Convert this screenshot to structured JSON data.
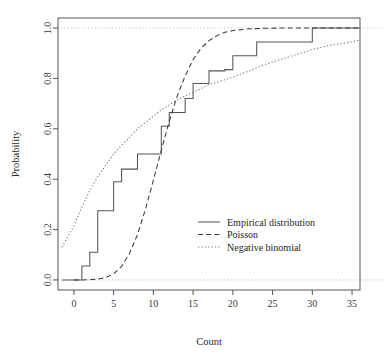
{
  "chart_data": {
    "type": "line",
    "title": "",
    "xlabel": "Count",
    "ylabel": "Probability",
    "xlim": [
      -2,
      36
    ],
    "ylim": [
      -0.04,
      1.04
    ],
    "grid": false,
    "reference_lines": [
      {
        "name": "upper-reference",
        "y": 1.0,
        "style": "dotted",
        "color": "#bdbdbd"
      },
      {
        "name": "lower-reference",
        "y": 0.0,
        "style": "dotted",
        "color": "#bdbdbd"
      }
    ],
    "xticks": [
      0,
      5,
      10,
      15,
      20,
      25,
      30,
      35
    ],
    "xtick_labels": [
      "0",
      "5",
      "10",
      "15",
      "20",
      "25",
      "30",
      "35"
    ],
    "yticks": [
      0.0,
      0.2,
      0.4,
      0.6,
      0.8,
      1.0
    ],
    "ytick_labels": [
      "0.0",
      "0.2",
      "0.4",
      "0.6",
      "0.8",
      "1.0"
    ],
    "legend_position": "center-right",
    "legend": [
      {
        "label": "Empirical distribution",
        "style": "solid",
        "color": "#555555"
      },
      {
        "label": "Poisson",
        "style": "dashed",
        "color": "#3a3a3a"
      },
      {
        "label": "Negative binomial",
        "style": "dotted",
        "color": "#777777"
      }
    ],
    "series": [
      {
        "name": "Empirical distribution",
        "style": "solid",
        "color": "#555555",
        "type": "step",
        "x": [
          0,
          1,
          2,
          3,
          4,
          5,
          6,
          7,
          8,
          9,
          10,
          11,
          12,
          13,
          14,
          15,
          16,
          17,
          18,
          19,
          20,
          23,
          30
        ],
        "y": [
          0.0,
          0.055,
          0.11,
          0.275,
          0.275,
          0.39,
          0.44,
          0.44,
          0.5,
          0.5,
          0.5,
          0.61,
          0.665,
          0.665,
          0.72,
          0.78,
          0.78,
          0.83,
          0.83,
          0.835,
          0.89,
          0.945,
          1.0
        ]
      },
      {
        "name": "Poisson",
        "style": "dashed",
        "color": "#3a3a3a",
        "type": "curve",
        "x": [
          0,
          1,
          2,
          3,
          4,
          5,
          6,
          7,
          8,
          9,
          10,
          11,
          12,
          13,
          14,
          15,
          16,
          17,
          18,
          19,
          20,
          22,
          24,
          26,
          28,
          30,
          33,
          36
        ],
        "y": [
          0.0,
          0.0,
          0.001,
          0.003,
          0.009,
          0.024,
          0.054,
          0.105,
          0.18,
          0.28,
          0.395,
          0.515,
          0.63,
          0.73,
          0.81,
          0.875,
          0.92,
          0.95,
          0.97,
          0.983,
          0.99,
          0.997,
          0.999,
          1.0,
          1.0,
          1.0,
          1.0,
          1.0
        ]
      },
      {
        "name": "Negative binomial",
        "style": "dotted",
        "color": "#777777",
        "type": "curve",
        "x": [
          -1.5,
          0,
          1,
          2,
          3,
          4,
          5,
          6,
          7,
          8,
          9,
          10,
          11,
          12,
          13,
          14,
          15,
          16,
          17,
          18,
          19,
          20,
          22,
          24,
          26,
          28,
          30,
          32,
          34,
          36
        ],
        "y": [
          0.13,
          0.215,
          0.29,
          0.355,
          0.41,
          0.455,
          0.5,
          0.535,
          0.565,
          0.6,
          0.625,
          0.65,
          0.675,
          0.695,
          0.715,
          0.73,
          0.745,
          0.76,
          0.775,
          0.785,
          0.795,
          0.805,
          0.83,
          0.855,
          0.875,
          0.895,
          0.915,
          0.93,
          0.94,
          0.952
        ]
      }
    ]
  }
}
